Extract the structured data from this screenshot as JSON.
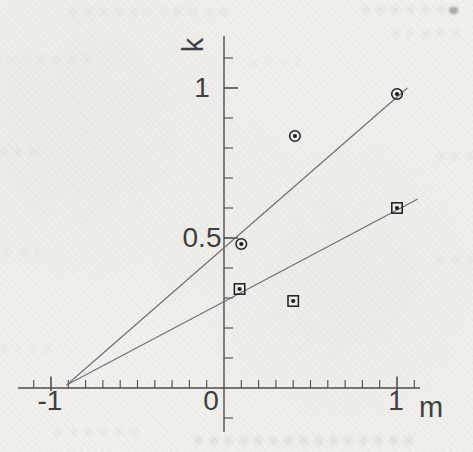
{
  "chart_data": {
    "type": "scatter",
    "title": "",
    "xlabel": "m",
    "ylabel": "k",
    "xlim": [
      -1.14,
      1.15
    ],
    "ylim": [
      -0.13,
      1.17
    ],
    "grid": false,
    "legend": "none",
    "minor_tick_step": 0.1,
    "x_major_ticks": [
      {
        "value": -1,
        "label": "-1"
      },
      {
        "value": 0,
        "label": "0"
      },
      {
        "value": 1,
        "label": "1"
      }
    ],
    "y_major_ticks": [
      {
        "value": 0.5,
        "label": "0.5"
      },
      {
        "value": 1,
        "label": "1"
      }
    ],
    "series": [
      {
        "name": "circled-dot points",
        "marker": "dot-in-circle",
        "points": [
          [
            0.1,
            0.48
          ],
          [
            0.41,
            0.84
          ],
          [
            1.0,
            0.98
          ]
        ]
      },
      {
        "name": "squared-dot points",
        "marker": "dot-in-square",
        "points": [
          [
            0.09,
            0.33
          ],
          [
            0.4,
            0.29
          ],
          [
            1.0,
            0.6
          ]
        ]
      }
    ],
    "fit_lines": [
      {
        "name": "steep-fit-line",
        "through": "circled-dot points",
        "from": [
          -0.91,
          0.01
        ],
        "to": [
          1.06,
          1.0
        ],
        "slope": 0.5
      },
      {
        "name": "shallow-fit-line",
        "through": "squared-dot points",
        "from": [
          -0.91,
          0.01
        ],
        "to": [
          1.12,
          0.63
        ],
        "slope": 0.31
      }
    ]
  },
  "colors": {
    "paper": "#f2f1ed",
    "axis_ink": "#4c4c4c",
    "line_ink": "#6e6e6e",
    "marker_ink": "#1e1e1e",
    "label_ink": "#3f3f3f"
  }
}
